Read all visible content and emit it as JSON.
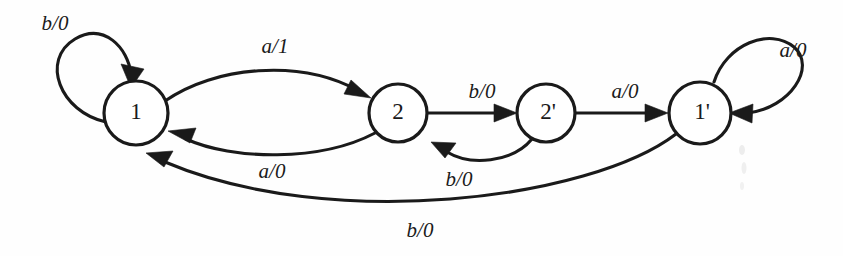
{
  "diagram": {
    "type": "finite-state-machine",
    "title": "",
    "width": 843,
    "height": 256,
    "background_color": "#fefefe",
    "ink_color": "#1a1a1a",
    "states": [
      {
        "id": "s1",
        "label": "1",
        "cx": 136,
        "cy": 113,
        "r": 32
      },
      {
        "id": "s2",
        "label": "2",
        "cx": 398,
        "cy": 113,
        "r": 29
      },
      {
        "id": "s2p",
        "label": "2'",
        "cx": 546,
        "cy": 113,
        "r": 29
      },
      {
        "id": "s1p",
        "label": "1'",
        "cx": 700,
        "cy": 113,
        "r": 31
      }
    ],
    "transitions": [
      {
        "id": "t1",
        "from": "s1",
        "to": "s1",
        "label": "b/0",
        "label_x": 55,
        "label_y": 25,
        "kind": "self-loop-left"
      },
      {
        "id": "t2",
        "from": "s1",
        "to": "s2",
        "label": "a/1",
        "label_x": 275,
        "label_y": 48,
        "kind": "arc-upper"
      },
      {
        "id": "t3",
        "from": "s2",
        "to": "s1",
        "label": "a/0",
        "label_x": 272,
        "label_y": 173,
        "kind": "arc-lower"
      },
      {
        "id": "t4",
        "from": "s2",
        "to": "s2p",
        "label": "b/0",
        "label_x": 482,
        "label_y": 93,
        "kind": "straight"
      },
      {
        "id": "t5",
        "from": "s2p",
        "to": "s2",
        "label": "b/0",
        "label_x": 459,
        "label_y": 181,
        "kind": "arc-lower-short"
      },
      {
        "id": "t6",
        "from": "s2p",
        "to": "s1p",
        "label": "a/0",
        "label_x": 625,
        "label_y": 93,
        "kind": "straight"
      },
      {
        "id": "t7",
        "from": "s1p",
        "to": "s1p",
        "label": "a/0",
        "label_x": 793,
        "label_y": 52,
        "kind": "self-loop-right"
      },
      {
        "id": "t8",
        "from": "s1p",
        "to": "s1",
        "label": "b/0",
        "label_x": 420,
        "label_y": 232,
        "kind": "arc-bottom-long"
      }
    ],
    "alphabet_inputs": [
      "a",
      "b"
    ],
    "alphabet_outputs": [
      "0",
      "1"
    ]
  }
}
